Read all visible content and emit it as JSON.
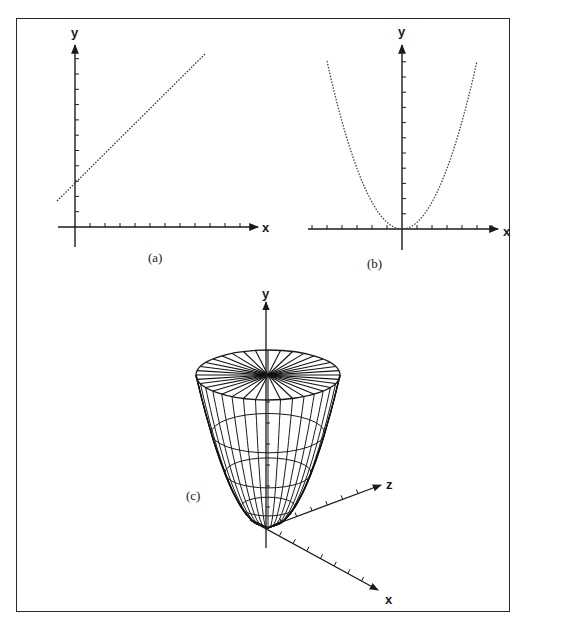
{
  "figure": {
    "panels": [
      {
        "id": "a",
        "caption": "(a)",
        "x_label": "x",
        "y_label": "y",
        "curve": "straight line",
        "description": "Linear function with positive slope and positive y-intercept"
      },
      {
        "id": "b",
        "caption": "(b)",
        "x_label": "x",
        "y_label": "y",
        "curve": "parabola",
        "description": "Parabola with vertex at origin opening upward"
      },
      {
        "id": "c",
        "caption": "(c)",
        "x_label": "x",
        "y_label": "y",
        "z_label": "z",
        "curve": "paraboloid",
        "description": "3D wireframe paraboloid of revolution about the y-axis"
      }
    ]
  },
  "chart_data": [
    {
      "type": "line",
      "title": "(a)",
      "xlabel": "x",
      "ylabel": "y",
      "x_ticks": 11,
      "y_ticks": 11,
      "equation": "y = m*x + b",
      "intercept_tick": 3
    },
    {
      "type": "line",
      "title": "(b)",
      "xlabel": "x",
      "ylabel": "y",
      "x_ticks_each_side": 6,
      "y_ticks": 11,
      "equation": "y = k*x^2"
    },
    {
      "type": "other",
      "title": "(c)",
      "xlabel": "x",
      "ylabel": "y",
      "zlabel": "z",
      "surface": "paraboloid",
      "radial_segments": 36,
      "rings": 4
    }
  ]
}
